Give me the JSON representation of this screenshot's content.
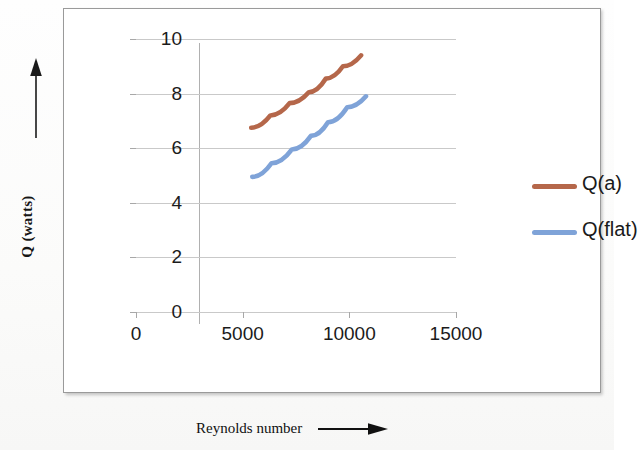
{
  "chart_data": {
    "type": "line",
    "title": "",
    "xlabel": "Reynolds number",
    "ylabel": "Q (watts)",
    "xlim": [
      0,
      15000
    ],
    "ylim": [
      0,
      10
    ],
    "grid": true,
    "legend_position": "right",
    "x_ticks": [
      "0",
      "5000",
      "10000",
      "15000"
    ],
    "x_tick_values": [
      0,
      5000,
      10000,
      15000
    ],
    "y_ticks": [
      "0",
      "2",
      "4",
      "6",
      "8",
      "10"
    ],
    "y_tick_values": [
      0,
      2,
      4,
      6,
      8,
      10
    ],
    "series": [
      {
        "name": "Q(a)",
        "color": "#b5674a",
        "x": [
          5400,
          6300,
          7200,
          8100,
          8900,
          9700,
          10550
        ],
        "values": [
          6.75,
          7.2,
          7.65,
          8.05,
          8.55,
          9.0,
          9.4
        ]
      },
      {
        "name": "Q(flat)",
        "color": "#7fa3d8",
        "x": [
          5450,
          6350,
          7300,
          8200,
          9000,
          9900,
          10780
        ],
        "values": [
          4.95,
          5.45,
          5.95,
          6.45,
          6.95,
          7.5,
          7.9
        ]
      }
    ]
  },
  "axes": {
    "y_label": "Q (watts)",
    "x_label": "Reynolds number",
    "y_arrow_icon": "up-arrow-icon",
    "x_arrow_icon": "right-arrow-icon"
  },
  "legend": {
    "items": [
      {
        "label": "Q(a)",
        "color": "#b5674a"
      },
      {
        "label": "Q(flat)",
        "color": "#7fa3d8"
      }
    ]
  }
}
